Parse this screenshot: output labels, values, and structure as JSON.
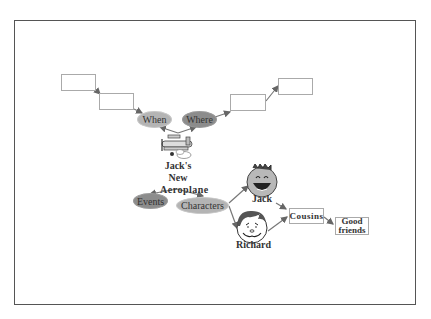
{
  "diagram": {
    "title": "Jack's New Aeroplane",
    "center": {
      "label_lines": [
        "Jack's",
        "New",
        "Aeroplane"
      ],
      "icon": "aeroplane-icon"
    },
    "branches": {
      "when": {
        "label": "When",
        "color": "#b4b4b4",
        "boxes": [
          "",
          ""
        ]
      },
      "where": {
        "label": "Where",
        "color": "#8c8c8c",
        "boxes": [
          "",
          ""
        ]
      },
      "events": {
        "label": "Events",
        "color": "#8c8c8c"
      },
      "characters": {
        "label": "Characters",
        "color": "#b4b4b4"
      }
    },
    "characters": [
      {
        "name": "Jack",
        "icon": "laughing-face-icon"
      },
      {
        "name": "Richard",
        "icon": "smiling-face-icon"
      }
    ],
    "relations": {
      "cousins": "Cousins",
      "good_friends_lines": [
        "Good",
        "friends"
      ]
    }
  }
}
